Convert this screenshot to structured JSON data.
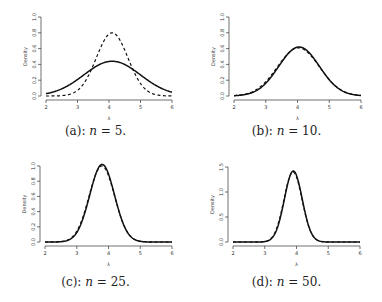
{
  "chart_data": [
    {
      "type": "line",
      "panel": "a",
      "caption": "(a): n = 5.",
      "caption_prefix": "(a): ",
      "caption_n": "n",
      "caption_suffix": " = 5.",
      "xlabel": "λ",
      "ylabel": "Density",
      "xlim": [
        2,
        6
      ],
      "ylim": [
        0,
        1.0
      ],
      "xticks": [
        "2",
        "3",
        "4",
        "5",
        "6"
      ],
      "yticks": [
        "0.0",
        "0.2",
        "0.4",
        "0.6",
        "0.8",
        "1.0"
      ],
      "series": [
        {
          "name": "solid",
          "style": "solid",
          "mean": 4.1,
          "sd": 0.9,
          "peak": 0.44
        },
        {
          "name": "dashed",
          "style": "dashed",
          "mean": 4.1,
          "sd": 0.5,
          "peak": 0.8
        }
      ]
    },
    {
      "type": "line",
      "panel": "b",
      "caption": "(b): n = 10.",
      "caption_prefix": "(b): ",
      "caption_n": "n",
      "caption_suffix": " = 10.",
      "xlabel": "λ",
      "ylabel": "Density",
      "xlim": [
        2,
        6
      ],
      "ylim": [
        0,
        1.0
      ],
      "xticks": [
        "2",
        "3",
        "4",
        "5",
        "6"
      ],
      "yticks": [
        "0.0",
        "0.2",
        "0.4",
        "0.6",
        "0.8",
        "1.0"
      ],
      "series": [
        {
          "name": "solid",
          "style": "solid",
          "mean": 4.05,
          "sd": 0.64,
          "peak": 0.62
        },
        {
          "name": "dashed",
          "style": "dashed",
          "mean": 4.03,
          "sd": 0.66,
          "peak": 0.61
        }
      ]
    },
    {
      "type": "line",
      "panel": "c",
      "caption": "(c): n = 25.",
      "caption_prefix": "(c): ",
      "caption_n": "n",
      "caption_suffix": " = 25.",
      "xlabel": "λ",
      "ylabel": "Density",
      "xlim": [
        2,
        6
      ],
      "ylim": [
        0,
        1.0
      ],
      "xticks": [
        "2",
        "3",
        "4",
        "5",
        "6"
      ],
      "yticks": [
        "0.0",
        "0.2",
        "0.4",
        "0.6",
        "0.8",
        "1.0"
      ],
      "series": [
        {
          "name": "solid",
          "style": "solid",
          "mean": 3.8,
          "sd": 0.39,
          "peak": 1.02
        },
        {
          "name": "dashed",
          "style": "dashed",
          "mean": 3.79,
          "sd": 0.4,
          "peak": 1.0
        }
      ]
    },
    {
      "type": "line",
      "panel": "d",
      "caption": "(d): n = 50.",
      "caption_prefix": "(d): ",
      "caption_n": "n",
      "caption_suffix": " = 50.",
      "xlabel": "λ",
      "ylabel": "Density",
      "xlim": [
        2,
        6
      ],
      "ylim": [
        0,
        1.5
      ],
      "xticks": [
        "2",
        "3",
        "4",
        "5",
        "6"
      ],
      "yticks": [
        "0.0",
        "0.5",
        "1.0",
        "1.5"
      ],
      "series": [
        {
          "name": "solid",
          "style": "solid",
          "mean": 3.9,
          "sd": 0.28,
          "peak": 1.42
        },
        {
          "name": "dashed",
          "style": "dashed",
          "mean": 3.89,
          "sd": 0.285,
          "peak": 1.4
        }
      ]
    }
  ]
}
